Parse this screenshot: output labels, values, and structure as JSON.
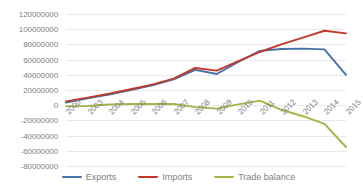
{
  "chart_data": {
    "type": "line",
    "title": "",
    "xlabel": "",
    "ylabel": "",
    "grid": true,
    "legend_position": "bottom",
    "ylim": [
      -80000000,
      120000000
    ],
    "ytick_step": 20000000,
    "ytick_labels": [
      "120000000",
      "100000000",
      "80000000",
      "60000000",
      "40000000",
      "20000000",
      "0",
      "-20000000",
      "-40000000",
      "-60000000",
      "-80000000"
    ],
    "ytick_values": [
      120000000,
      100000000,
      80000000,
      60000000,
      40000000,
      20000000,
      0,
      -20000000,
      -40000000,
      -60000000,
      -80000000
    ],
    "categories": [
      "2000",
      "2003",
      "2004",
      "2005",
      "2006",
      "2007",
      "2008",
      "2009",
      "2010",
      "2011",
      "2012",
      "2013",
      "2014",
      "2015"
    ],
    "series": [
      {
        "name": "Exports",
        "color": "#4472a8",
        "values": [
          3500000,
          9000000,
          14000000,
          20000000,
          26000000,
          34000000,
          46500000,
          41000000,
          57000000,
          71500000,
          74000000,
          74500000,
          73500000,
          40000000
        ]
      },
      {
        "name": "Imports",
        "color": "#c0392b",
        "values": [
          5000000,
          10000000,
          15000000,
          21000000,
          27000000,
          35000000,
          49000000,
          45500000,
          58000000,
          70000000,
          80000000,
          89000000,
          98000000,
          94500000
        ]
      },
      {
        "name": "Trade balance",
        "color": "#a0b748",
        "values": [
          -1500000,
          -1000000,
          1000000,
          1500000,
          1500000,
          1500000,
          -2500000,
          -4500000,
          1000000,
          6000000,
          -6000000,
          -14500000,
          -24500000,
          -55000000
        ]
      }
    ]
  },
  "legend": {
    "items": [
      {
        "label": "Exports",
        "color": "#4472a8"
      },
      {
        "label": "Imports",
        "color": "#c0392b"
      },
      {
        "label": "Trade balance",
        "color": "#a0b748"
      }
    ]
  }
}
